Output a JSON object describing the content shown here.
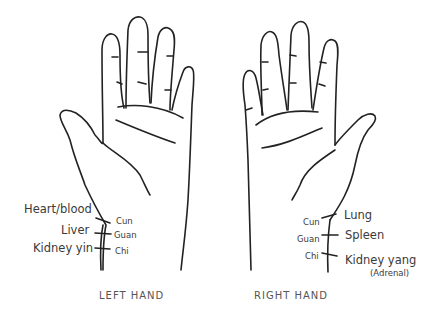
{
  "left_hand": {
    "caption": "LEFT HAND",
    "organs": [
      "Heart/blood",
      "Liver",
      "Kidney yin"
    ],
    "positions": [
      "Cun",
      "Guan",
      "Chi"
    ]
  },
  "right_hand": {
    "caption": "RIGHT HAND",
    "organs": [
      "Lung",
      "Spleen",
      "Kidney yang"
    ],
    "organ_note": "(Adrenal)",
    "positions": [
      "Cun",
      "Guan",
      "Chi"
    ]
  },
  "colors": {
    "line": "#222222",
    "text": "#3a3a3a",
    "background": "#ffffff"
  }
}
